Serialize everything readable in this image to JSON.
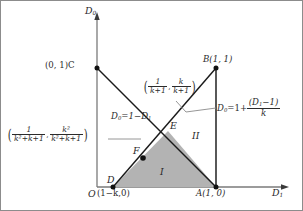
{
  "figure": {
    "type": "geometric-region-diagram",
    "axes": {
      "x_label_base": "D",
      "x_label_sub": "1",
      "y_label_base": "D",
      "y_label_sub": "0",
      "origin_label": "O"
    },
    "points": [
      {
        "id": "O",
        "name": "origin",
        "label": "O",
        "coord_text": "",
        "x": 0,
        "y": 0,
        "dot": false
      },
      {
        "id": "A",
        "name": "point-a",
        "label": "A",
        "coord_text": "(1, 0)",
        "x": 1,
        "y": 0,
        "dot": true
      },
      {
        "id": "B",
        "name": "point-b",
        "label": "B",
        "coord_text": "(1, 1)",
        "x": 1,
        "y": 1,
        "dot": true
      },
      {
        "id": "C",
        "name": "point-c",
        "label": "C",
        "coord_text": "(0, 1)",
        "x": 0,
        "y": 1,
        "dot": true
      },
      {
        "id": "D",
        "name": "point-d",
        "label": "D",
        "coord_text": "(1−k,0)",
        "x": "1-k",
        "y": 0,
        "dot": true
      },
      {
        "id": "E",
        "name": "point-e",
        "label": "E",
        "coord_text": "",
        "x": "1/(k+1)",
        "y": "k/(k+1)",
        "dot": false
      },
      {
        "id": "F",
        "name": "point-f",
        "label": "F",
        "coord_text": "",
        "x": "1/(k^2+k+1)",
        "y": "k^2/(k^2+k+1)",
        "dot": true
      }
    ],
    "point_labels": {
      "c_label": "(0, 1)C",
      "b_label": "B(1, 1)",
      "a_label": "A(1, 0)",
      "d_label": "D",
      "d_coord": "(1−k,0)",
      "e_label": "E",
      "f_label": "F",
      "origin": "O"
    },
    "lines": [
      {
        "id": "CA",
        "name": "line-c-a",
        "equation_text": "D₀=1−D₁",
        "eq_lhs_base": "D",
        "eq_lhs_sub": "0",
        "eq_rhs": "1−D",
        "eq_rhs_sub": "1",
        "from": "C",
        "to": "A"
      },
      {
        "id": "DB",
        "name": "line-d-b",
        "equation_text": "D₀=1+(D₁−1)/k",
        "eq_lhs_base": "D",
        "eq_lhs_sub": "0",
        "eq_rhs_prefix": "=1+",
        "frac_numerator": "(D₁−1)",
        "frac_num_base": "(D",
        "frac_num_sub": "1",
        "frac_num_tail": "−1)",
        "frac_denominator": "k",
        "from": "D",
        "to": "B"
      }
    ],
    "coord_annotations": [
      {
        "id": "E-coord",
        "name": "coordinate-label-e",
        "for_point": "E",
        "text": "( 1/(k+1) , k/(k+1) )",
        "x_num": "1",
        "x_den": "k+1",
        "y_num": "k",
        "y_den": "k+1"
      },
      {
        "id": "F-coord",
        "name": "coordinate-label-f",
        "for_point": "F",
        "text": "( 1/(k²+k+1) , k²/(k²+k+1) )",
        "x_num": "1",
        "x_den": "k²+k+1",
        "y_num": "k²",
        "y_den": "k²+k+1"
      }
    ],
    "regions": [
      {
        "id": "I",
        "name": "region-one",
        "label": "I",
        "shaded": true,
        "fill": "#b3b3b3",
        "vertices": [
          "D",
          "E",
          "A"
        ]
      },
      {
        "id": "II",
        "name": "region-two",
        "label": "II",
        "shaded": false,
        "fill": "#ffffff",
        "vertices": [
          "E",
          "B",
          "A"
        ]
      }
    ],
    "colors": {
      "stroke_main": "#1a1a1a",
      "stroke_axis": "#7a7a7a",
      "stroke_leader": "#8a8a8a",
      "region_fill": "#b3b3b3",
      "text": "#2b2b2b",
      "background": "#ffffff",
      "border": "#8c8c8c"
    }
  }
}
